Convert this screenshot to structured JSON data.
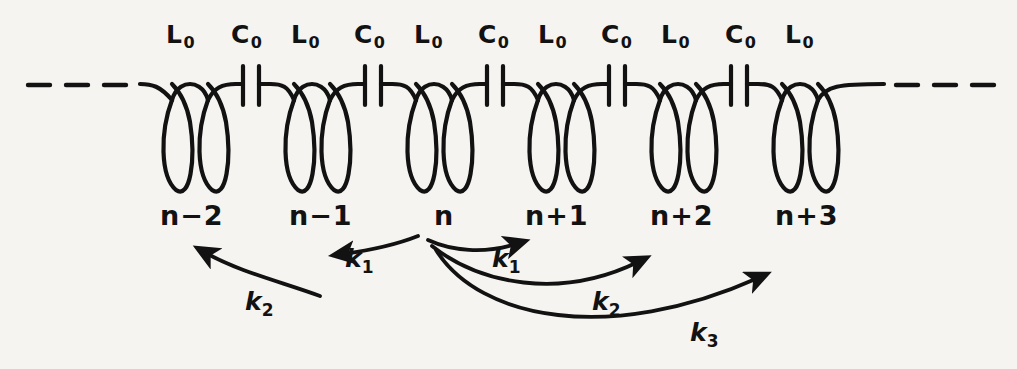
{
  "figure": {
    "name": "lc-ladder-circuit-with-coupling-constants",
    "background_color": "#f6f4f1",
    "ink_color": "#121212"
  },
  "component_labels": [
    {
      "id": "comp-0",
      "text": "L",
      "sub": "0",
      "x": 166,
      "y": 22
    },
    {
      "id": "comp-1",
      "text": "C",
      "sub": "0",
      "x": 231,
      "y": 22
    },
    {
      "id": "comp-2",
      "text": "L",
      "sub": "0",
      "x": 291,
      "y": 22
    },
    {
      "id": "comp-3",
      "text": "C",
      "sub": "0",
      "x": 354,
      "y": 22
    },
    {
      "id": "comp-4",
      "text": "L",
      "sub": "0",
      "x": 414,
      "y": 22
    },
    {
      "id": "comp-5",
      "text": "C",
      "sub": "0",
      "x": 478,
      "y": 22
    },
    {
      "id": "comp-6",
      "text": "L",
      "sub": "0",
      "x": 538,
      "y": 22
    },
    {
      "id": "comp-7",
      "text": "C",
      "sub": "0",
      "x": 601,
      "y": 22
    },
    {
      "id": "comp-8",
      "text": "L",
      "sub": "0",
      "x": 661,
      "y": 22
    },
    {
      "id": "comp-9",
      "text": "C",
      "sub": "0",
      "x": 725,
      "y": 22
    },
    {
      "id": "comp-10",
      "text": "L",
      "sub": "0",
      "x": 785,
      "y": 22
    }
  ],
  "site_labels": [
    {
      "id": "site-n-minus-2",
      "text": "n−2",
      "x": 160,
      "y": 202
    },
    {
      "id": "site-n-minus-1",
      "text": "n−1",
      "x": 289,
      "y": 202
    },
    {
      "id": "site-n",
      "text": "n",
      "x": 434,
      "y": 202
    },
    {
      "id": "site-n-plus-1",
      "text": "n+1",
      "x": 525,
      "y": 202
    },
    {
      "id": "site-n-plus-2",
      "text": "n+2",
      "x": 650,
      "y": 202
    },
    {
      "id": "site-n-plus-3",
      "text": "n+3",
      "x": 775,
      "y": 202
    }
  ],
  "coupling_labels": [
    {
      "id": "k1-left",
      "text": "k",
      "sub": "1",
      "x": 345,
      "y": 246
    },
    {
      "id": "k1-right",
      "text": "k",
      "sub": "1",
      "x": 492,
      "y": 246
    },
    {
      "id": "k2-left",
      "text": "k",
      "sub": "2",
      "x": 245,
      "y": 289
    },
    {
      "id": "k2-right",
      "text": "k",
      "sub": "2",
      "x": 592,
      "y": 289
    },
    {
      "id": "k3-right",
      "text": "k",
      "sub": "3",
      "x": 690,
      "y": 320
    }
  ],
  "circuit": {
    "wire_y": 86,
    "inductor_centers": [
      190,
      312,
      434,
      556,
      678,
      800
    ],
    "capacitor_centers": [
      251,
      373,
      495,
      617,
      739
    ],
    "loop_bottom_y": 192,
    "dash_left": "dashed lead-in from left",
    "dash_right": "dashed lead-out to right"
  },
  "arrows": [
    {
      "id": "arrow-n-to-n-minus-2",
      "coupling": "k2",
      "direction": "left"
    },
    {
      "id": "arrow-n-to-n-minus-1",
      "coupling": "k1",
      "direction": "left"
    },
    {
      "id": "arrow-n-to-n-plus-1",
      "coupling": "k1",
      "direction": "right"
    },
    {
      "id": "arrow-n-to-n-plus-2",
      "coupling": "k2",
      "direction": "right"
    },
    {
      "id": "arrow-n-to-n-plus-3",
      "coupling": "k3",
      "direction": "right"
    }
  ]
}
